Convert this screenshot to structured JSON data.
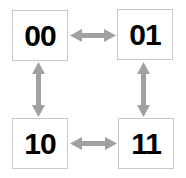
{
  "diagram": {
    "nodes": [
      {
        "id": "00",
        "label": "00"
      },
      {
        "id": "01",
        "label": "01"
      },
      {
        "id": "10",
        "label": "10"
      },
      {
        "id": "11",
        "label": "11"
      }
    ],
    "edges": [
      {
        "from": "00",
        "to": "01",
        "type": "bidirectional"
      },
      {
        "from": "00",
        "to": "10",
        "type": "bidirectional"
      },
      {
        "from": "01",
        "to": "11",
        "type": "bidirectional"
      },
      {
        "from": "10",
        "to": "11",
        "type": "bidirectional"
      }
    ],
    "colors": {
      "arrow": "#a0a0a0",
      "box_border": "#c8c8c8",
      "text": "#000000"
    }
  }
}
